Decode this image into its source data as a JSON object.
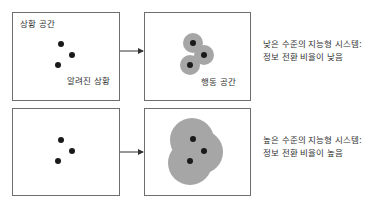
{
  "top_row": {
    "situation_box": {
      "title": "상황 공간",
      "dots_label": "알려진 상황"
    },
    "action_box": {
      "label": "행동 공간"
    },
    "description": {
      "line1": "낮은 수준의 지능형 시스템:",
      "line2": "정보 전환 비율이 낮음"
    }
  },
  "bottom_row": {
    "description": {
      "line1": "높은 수준의 지능형 시스템:",
      "line2": "정보 전환 비율이 높음"
    }
  },
  "colors": {
    "dot": "#1a1a1a",
    "coverage_gray": "#a6a6a6",
    "border": "#6e6e6e"
  }
}
